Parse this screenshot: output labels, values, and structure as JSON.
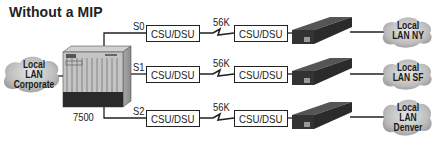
{
  "title": "Without a MIP",
  "router": {
    "model": "7500"
  },
  "source_lan": {
    "line1": "Local",
    "line2": "LAN",
    "line3": "Corporate"
  },
  "links": [
    {
      "port": "S0",
      "speed": "56K",
      "local_csu": "CSU/DSU",
      "remote_csu": "CSU/DSU",
      "lan_line1": "Local",
      "lan_line2": "LAN NY",
      "lan_line3": ""
    },
    {
      "port": "S1",
      "speed": "56K",
      "local_csu": "CSU/DSU",
      "remote_csu": "CSU/DSU",
      "lan_line1": "Local",
      "lan_line2": "LAN SF",
      "lan_line3": ""
    },
    {
      "port": "S2",
      "speed": "56K",
      "local_csu": "CSU/DSU",
      "remote_csu": "CSU/DSU",
      "lan_line1": "Local",
      "lan_line2": "LAN",
      "lan_line3": "Denver"
    }
  ],
  "colors": {
    "line": "#222222",
    "cloud": "#c8c8c8",
    "device_dark": "#3a3a3a",
    "router_body": "#b5b5b5"
  }
}
